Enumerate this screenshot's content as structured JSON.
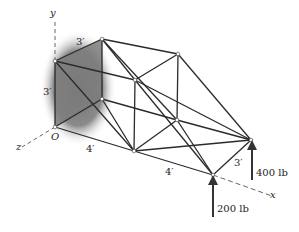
{
  "figure": {
    "axes": {
      "y": "y",
      "z": "z",
      "x": "x",
      "origin": "O"
    },
    "dimensions": {
      "top_depth": "3′",
      "height": "3′",
      "bottom_length": "4′",
      "right_length": "4′",
      "right_depth": "3′"
    },
    "loads": {
      "load_a": "400 lb",
      "load_b": "200 lb"
    },
    "colors": {
      "member": "#2b2b2b",
      "shade": "#7a7a7a",
      "axis": "#666666"
    }
  }
}
